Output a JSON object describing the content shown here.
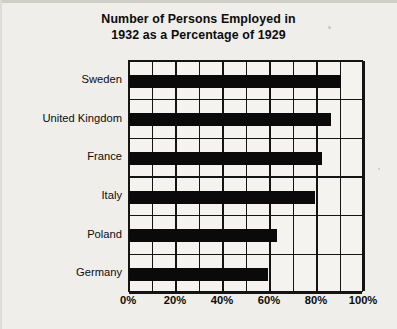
{
  "chart_data": {
    "type": "bar",
    "orientation": "horizontal",
    "title": "Number of Persons Employed in 1932 as a Percentage of 1929",
    "title_line1": "Number of Persons Employed in",
    "title_line2": "1932 as a Percentage of 1929",
    "xlabel": "",
    "ylabel": "",
    "categories": [
      "Sweden",
      "United Kingdom",
      "France",
      "Italy",
      "Poland",
      "Germany"
    ],
    "values": [
      90,
      86,
      82,
      79,
      63,
      59
    ],
    "value_suffix": "%",
    "xlim": [
      0,
      100
    ],
    "xticks": [
      0,
      20,
      40,
      60,
      80,
      100
    ],
    "xtick_labels": [
      "0%",
      "20%",
      "40%",
      "60%",
      "80%",
      "100%"
    ],
    "minor_tick_step": 10,
    "grid": "both",
    "legend": "none",
    "bar_color": "#0a0a0a",
    "plot_background": "#f4f3ef",
    "page_background": "#efeeea",
    "axis_color": "#141414"
  }
}
